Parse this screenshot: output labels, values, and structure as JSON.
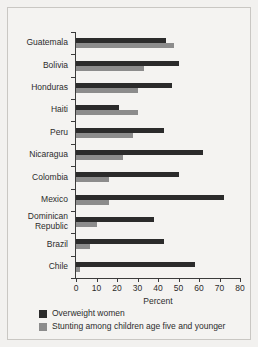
{
  "chart_data": {
    "type": "bar",
    "orientation": "horizontal",
    "title": "",
    "xlabel": "Percent",
    "ylabel": "",
    "xlim": [
      0,
      80
    ],
    "xticks": [
      0,
      10,
      20,
      30,
      40,
      50,
      60,
      70,
      80
    ],
    "grid": false,
    "legend_position": "bottom-left",
    "categories": [
      "Guatemala",
      "Bolivia",
      "Honduras",
      "Haiti",
      "Peru",
      "Nicaragua",
      "Colombia",
      "Mexico",
      "Dominican\nRepublic",
      "Brazil",
      "Chile"
    ],
    "series": [
      {
        "name": "Overweight women",
        "color": "#2b2b2b",
        "values": [
          44,
          50,
          47,
          21,
          43,
          62,
          50,
          72,
          38,
          43,
          58
        ]
      },
      {
        "name": "Stunting among children age five and younger",
        "color": "#8c8c8c",
        "values": [
          48,
          33,
          30,
          30,
          28,
          23,
          16,
          16,
          10,
          7,
          2
        ]
      }
    ]
  },
  "colors": {
    "overweight": "#2b2b2b",
    "stunting": "#8c8c8c",
    "axis": "#3b3b3b",
    "text": "#2c2c2c",
    "background": "#f4f3f1",
    "border": "#c9c7c3"
  }
}
